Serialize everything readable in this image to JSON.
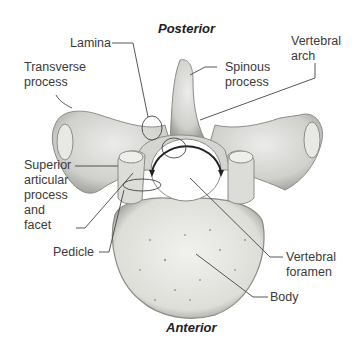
{
  "diagram": {
    "orientation": {
      "top": "Posterior",
      "bottom": "Anterior"
    },
    "labels": {
      "lamina": "Lamina",
      "transverse_process": "Transverse\nprocess",
      "spinous_process": "Spinous\nprocess",
      "vertebral_arch": "Vertebral\narch",
      "superior_articular": "Superior\narticular\nprocess\nand\nfacet",
      "pedicle": "Pedicle",
      "vertebral_foramen": "Vertebral\nforamen",
      "body": "Body"
    },
    "colors": {
      "bone": "#d9d9d6",
      "bone_shadow": "#a8a8a4",
      "body_fill": "#ecece8",
      "leader": "#444444"
    }
  }
}
